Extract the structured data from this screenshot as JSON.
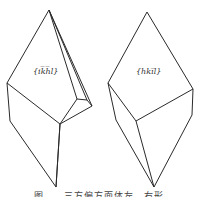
{
  "figure": {
    "left_crystal": {
      "face_label": "{ik̅h̅l}"
    },
    "right_crystal": {
      "face_label": "{hki̅l}"
    },
    "caption": "图 ... 三方偏方面体左、右形"
  }
}
